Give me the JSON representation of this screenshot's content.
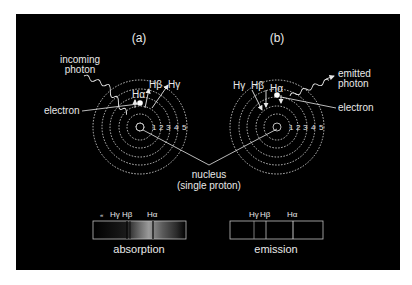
{
  "colors": {
    "background": "#ffffff",
    "panel": "#000000",
    "foreground": "#e8e8e8"
  },
  "panel_a": {
    "label": "(a)",
    "photon_label_1": "incoming",
    "photon_label_2": "photon",
    "electron_label": "electron",
    "transitions": [
      "Hα",
      "Hβ",
      "Hγ"
    ],
    "orbit_numbers": [
      "1",
      "2",
      "3",
      "4",
      "5"
    ]
  },
  "panel_b": {
    "label": "(b)",
    "photon_label_1": "emitted",
    "photon_label_2": "photon",
    "electron_label": "electron",
    "transitions": [
      "Hγ",
      "Hβ",
      "Hα"
    ],
    "orbit_numbers": [
      "1",
      "2",
      "3",
      "4",
      "5"
    ]
  },
  "nucleus": {
    "label_1": "nucleus",
    "label_2": "(single proton)"
  },
  "spectra": {
    "absorption": {
      "title": "absorption",
      "line_labels": [
        "Hγ",
        "Hβ",
        "Hα"
      ],
      "extra_mark": "«"
    },
    "emission": {
      "title": "emission",
      "line_labels": [
        "Hγ",
        "Hβ",
        "Hα"
      ]
    }
  }
}
